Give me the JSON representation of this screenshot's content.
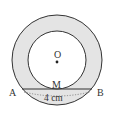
{
  "diagram": {
    "type": "concentric-circles-annulus",
    "colors": {
      "annulus_fill": "#e4e4e4",
      "stroke": "#333333",
      "background": "#ffffff"
    },
    "labels": {
      "center": "O",
      "tangent_point": "M",
      "chord_left": "A",
      "chord_right": "B",
      "chord_length": "4 cm"
    }
  }
}
